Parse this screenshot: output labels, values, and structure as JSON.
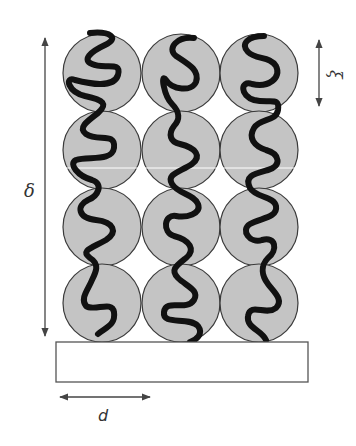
{
  "diagram": {
    "labels": {
      "height": "δ",
      "blob_size": "ξ",
      "spacing": "d"
    },
    "grid": {
      "columns": 3,
      "rows": 4
    },
    "colors": {
      "blob_fill": "#c4c4c4",
      "blob_stroke": "#3a3a3a",
      "chain": "#111111",
      "arrow": "#444444",
      "substrate_stroke": "#555555",
      "substrate_fill": "#ffffff"
    }
  }
}
